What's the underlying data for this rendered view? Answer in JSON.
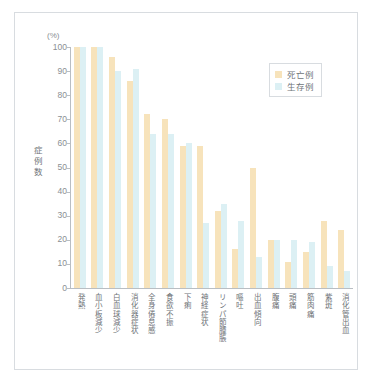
{
  "figure": {
    "unit_label": "(%)",
    "y_axis_title": "症例数",
    "legend": [
      {
        "key": "dead",
        "label": "死亡例",
        "color": "#f7e3bb"
      },
      {
        "key": "alive",
        "label": "生存例",
        "color": "#dcf0f4"
      }
    ]
  },
  "chart_data": {
    "type": "bar",
    "title": "",
    "xlabel": "",
    "ylabel": "症例数",
    "unit": "(%)",
    "ylim": [
      0,
      100
    ],
    "yticks": [
      0,
      10,
      20,
      30,
      40,
      50,
      60,
      70,
      80,
      90,
      100
    ],
    "grid": false,
    "legend_position": "top-right",
    "categories": [
      "発熱",
      "血小板減少",
      "白血球減少",
      "消化器症状",
      "全身倦怠感",
      "食欲不振",
      "下痢",
      "神経症状",
      "リンパ節腫脹",
      "嘔吐",
      "出血傾向",
      "腹痛",
      "頭痛",
      "筋肉痛",
      "紫斑",
      "消化管出血"
    ],
    "series": [
      {
        "name": "死亡例",
        "color": "#f7e3bb",
        "values": [
          100,
          100,
          96,
          86,
          72,
          70,
          59,
          59,
          32,
          16,
          50,
          20,
          11,
          15,
          28,
          24
        ]
      },
      {
        "name": "生存例",
        "color": "#dcf0f4",
        "values": [
          100,
          100,
          90,
          91,
          64,
          64,
          60,
          27,
          35,
          28,
          13,
          20,
          20,
          19,
          9,
          7
        ]
      }
    ]
  }
}
